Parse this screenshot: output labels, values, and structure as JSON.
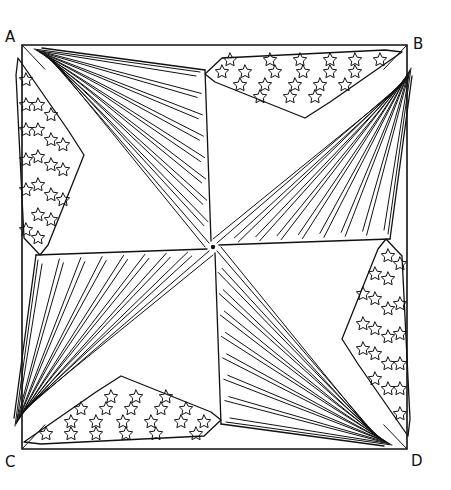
{
  "canvas": {
    "width": 451,
    "height": 490,
    "background": "#ffffff",
    "ink": "#111111"
  },
  "square": {
    "A": [
      22,
      45
    ],
    "B": [
      407,
      45
    ],
    "C": [
      22,
      449
    ],
    "D": [
      407,
      449
    ],
    "center": [
      213,
      247
    ]
  },
  "labels": [
    {
      "id": "A",
      "text": "A",
      "x": 5,
      "y": 30
    },
    {
      "id": "B",
      "text": "B",
      "x": 413,
      "y": 37
    },
    {
      "id": "C",
      "text": "C",
      "x": 5,
      "y": 455
    },
    {
      "id": "D",
      "text": "D",
      "x": 411,
      "y": 454
    }
  ],
  "flags": [
    {
      "name": "flag-from-A",
      "corner": "A"
    },
    {
      "name": "flag-from-B",
      "corner": "B"
    },
    {
      "name": "flag-from-C",
      "corner": "C"
    },
    {
      "name": "flag-from-D",
      "corner": "D"
    }
  ],
  "star_fields": [
    {
      "name": "stars-top",
      "count": 26
    },
    {
      "name": "stars-left",
      "count": 24
    },
    {
      "name": "stars-right",
      "count": 24
    },
    {
      "name": "stars-bottom",
      "count": 26
    }
  ],
  "center_dot": {
    "x": 213,
    "y": 247,
    "r": 2.2
  }
}
